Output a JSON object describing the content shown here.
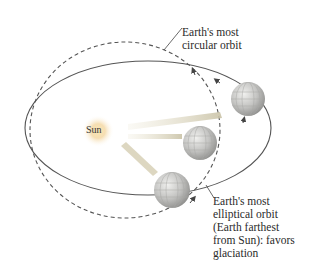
{
  "diagram": {
    "sun_label": "Sun",
    "circular_orbit_label": "Earth's most\ncircular orbit",
    "elliptical_orbit_label": "Earth's most\nelliptical orbit\n(Earth farthest\nfrom Sun): favors\nglaciation",
    "colors": {
      "orbit_line": "#555555",
      "sun_glow": "#f2d08a",
      "ray": "#cfc6a8",
      "globe": "#c8c8c8"
    },
    "elements": [
      {
        "id": "sun",
        "x": 98,
        "y": 131
      },
      {
        "id": "globe-near",
        "x": 200,
        "y": 143,
        "r": 17
      },
      {
        "id": "globe-far-right",
        "x": 248,
        "y": 99,
        "r": 17
      },
      {
        "id": "globe-bottom",
        "x": 172,
        "y": 190,
        "r": 18
      }
    ]
  }
}
